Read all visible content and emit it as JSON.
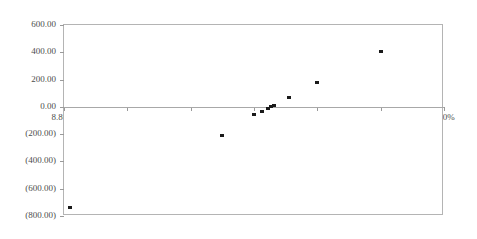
{
  "chart_data": {
    "type": "scatter",
    "title": "",
    "subtitle": "",
    "xlabel": "",
    "ylabel": "",
    "xlim": [
      8.8,
      9.4
    ],
    "ylim": [
      -800,
      600
    ],
    "grid": false,
    "legend": null,
    "x_tick_labels": [
      "8.80%",
      "8.90%",
      "9.00%",
      "9.10%",
      "9.20%",
      "9.30%",
      "9.40%"
    ],
    "x_tick_values": [
      8.8,
      8.9,
      9.0,
      9.1,
      9.2,
      9.3,
      9.4
    ],
    "y_tick_labels": [
      "600.00",
      "400.00",
      "200.00",
      "0.00",
      "(200.00)",
      "(400.00)",
      "(600.00)",
      "(800.00)"
    ],
    "y_tick_values": [
      600,
      400,
      200,
      0,
      -200,
      -400,
      -600,
      -800
    ],
    "series": [
      {
        "name": "Series 1",
        "marker": "square",
        "color": "#1a1a1a",
        "points": [
          {
            "x": 8.81,
            "y": -735
          },
          {
            "x": 9.05,
            "y": -205
          },
          {
            "x": 9.1,
            "y": -55
          },
          {
            "x": 9.112,
            "y": -30
          },
          {
            "x": 9.122,
            "y": -5
          },
          {
            "x": 9.127,
            "y": 8
          },
          {
            "x": 9.132,
            "y": 15
          },
          {
            "x": 9.155,
            "y": 70
          },
          {
            "x": 9.2,
            "y": 185
          },
          {
            "x": 9.3,
            "y": 410
          }
        ]
      }
    ]
  }
}
